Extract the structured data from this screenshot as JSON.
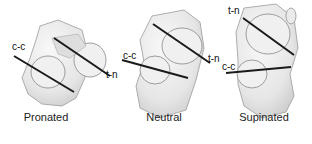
{
  "figure": {
    "panels": [
      {
        "id": "pronated",
        "caption": "Pronated",
        "labels": {
          "cc": "c-c",
          "tn": "t-n"
        }
      },
      {
        "id": "neutral",
        "caption": "Neutral",
        "labels": {
          "cc": "c-c",
          "tn": "t-n"
        }
      },
      {
        "id": "supinated",
        "caption": "Supinated",
        "labels": {
          "cc": "c-c",
          "tn": "t-n"
        }
      }
    ],
    "colors": {
      "bone_fill": "#ececec",
      "bone_shade": "#d4d4d4",
      "bone_outline": "#9a9a9a",
      "axis_line": "#1a1a1a"
    }
  }
}
